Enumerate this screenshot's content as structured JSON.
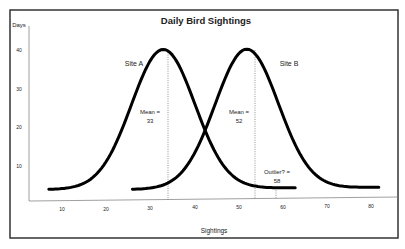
{
  "chart_data": {
    "type": "line",
    "title": "Daily Bird Sightings",
    "xlabel": "Sightings",
    "ylabel": "Days",
    "xlim": [
      5,
      85
    ],
    "ylim": [
      0,
      45
    ],
    "x_ticks": [
      "10",
      "20",
      "30",
      "40",
      "50",
      "60",
      "70",
      "80"
    ],
    "y_ticks": [
      "10",
      "20",
      "30",
      "40"
    ],
    "grid": false,
    "legend": "none",
    "series": [
      {
        "name": "Site A",
        "kind": "normal-curve",
        "mean": 33,
        "peak": 40,
        "baseline": 4,
        "x_range": [
          7,
          63
        ]
      },
      {
        "name": "Site B",
        "kind": "normal-curve",
        "mean": 52,
        "peak": 40,
        "baseline": 4,
        "x_range": [
          26,
          82
        ]
      }
    ],
    "annotations": [
      {
        "text_line1": "Mean =",
        "text_line2": "33",
        "x": 33,
        "style": "dotted-vertical"
      },
      {
        "text_line1": "Mean =",
        "text_line2": "52",
        "x": 52,
        "style": "dotted-vertical"
      },
      {
        "text_line1": "Outlier? =",
        "text_line2": "58",
        "x": 58,
        "style": "dotted-vertical"
      }
    ],
    "series_labels": [
      "Site A",
      "Site B"
    ]
  }
}
